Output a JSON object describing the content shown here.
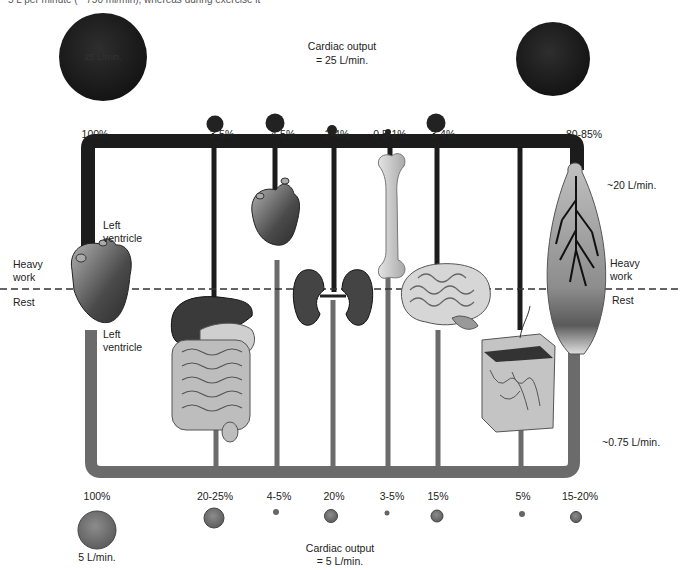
{
  "caption_cut": "5 L per minute (~ 750 ml/min), whereas during exercise it",
  "heavy_work": {
    "title_line1": "Cardiac output",
    "title_line2": "= 25 L/min.",
    "big_circle_label": "25 L/min.",
    "total_pct": "100%",
    "muscle_flow": "~20 L/min."
  },
  "rest": {
    "title_line1": "Cardiac output",
    "title_line2": "= 5 L/min.",
    "big_circle_label": "5 L/min.",
    "total_pct": "100%",
    "muscle_flow": "~0.75 L/min."
  },
  "labels": {
    "heavy_work_left_1": "Heavy",
    "heavy_work_left_2": "work",
    "rest_left": "Rest",
    "heavy_work_right_1": "Heavy",
    "heavy_work_right_2": "work",
    "rest_right": "Rest",
    "left_ventricle_top_1": "Left",
    "left_ventricle_top_2": "ventricle",
    "left_ventricle_bottom_1": "Left",
    "left_ventricle_bottom_2": "ventricle"
  },
  "organs": [
    {
      "name": "digestive-tract",
      "heavy_work_pct": "3-5%",
      "rest_pct": "20-25%"
    },
    {
      "name": "heart",
      "heavy_work_pct": "4-5%",
      "rest_pct": "4-5%"
    },
    {
      "name": "kidneys",
      "heavy_work_pct": "2-4%",
      "rest_pct": "20%"
    },
    {
      "name": "bone",
      "heavy_work_pct": "0.5-1%",
      "rest_pct": "3-5%"
    },
    {
      "name": "brain",
      "heavy_work_pct": "3-4%",
      "rest_pct": "15%"
    },
    {
      "name": "skin",
      "heavy_work_pct": "",
      "rest_pct": "5%"
    },
    {
      "name": "skeletal-muscle",
      "heavy_work_pct": "80-85%",
      "rest_pct": "15-20%"
    }
  ],
  "colors": {
    "heavy_pipe": "#1c1c1c",
    "rest_pipe": "#6b6b6b",
    "heavy_circle": "#1e1e1e",
    "rest_circle": "#7a7a7a"
  }
}
